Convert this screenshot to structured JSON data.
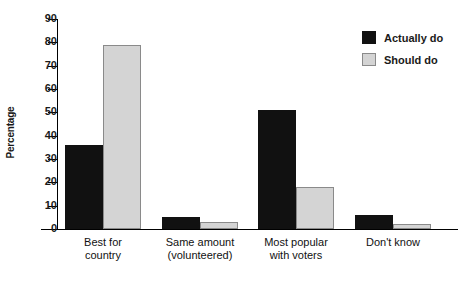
{
  "chart_data": {
    "type": "bar",
    "title": "",
    "xlabel": "",
    "ylabel": "Percentage",
    "ylim": [
      0,
      90
    ],
    "yticks": [
      0,
      10,
      20,
      30,
      40,
      50,
      60,
      70,
      80,
      90
    ],
    "grid": false,
    "legend_position": "top-right",
    "categories": [
      "Best for\ncountry",
      "Same amount\n(volunteered)",
      "Most popular\nwith voters",
      "Don't know"
    ],
    "category_lines": [
      [
        "Best for",
        "country"
      ],
      [
        "Same amount",
        "(volunteered)"
      ],
      [
        "Most popular",
        "with voters"
      ],
      [
        "Don't know",
        ""
      ]
    ],
    "series": [
      {
        "name": "Actually do",
        "color": "#111111",
        "values": [
          36,
          5,
          51,
          6
        ]
      },
      {
        "name": "Should do",
        "color": "#d4d4d4",
        "values": [
          79,
          3,
          18,
          2
        ]
      }
    ]
  },
  "legend": {
    "items": [
      {
        "label": "Actually do",
        "swatch": "actual"
      },
      {
        "label": "Should do",
        "swatch": "should"
      }
    ]
  },
  "axis": {
    "y_label": "Percentage",
    "y_ticks": [
      "90",
      "80",
      "70",
      "60",
      "50",
      "40",
      "30",
      "20",
      "10",
      "0"
    ]
  }
}
